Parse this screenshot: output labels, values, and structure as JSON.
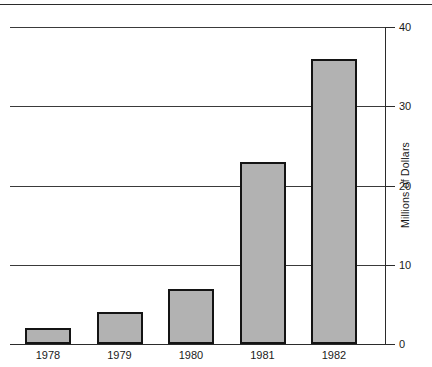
{
  "chart_data": {
    "type": "bar",
    "title": "",
    "subtitle": "",
    "xlabel": "",
    "ylabel": "Millions of Dollars",
    "categories": [
      "1978",
      "1979",
      "1980",
      "1981",
      "1982"
    ],
    "values": [
      2,
      4,
      7,
      23,
      36
    ],
    "series": [
      {
        "name": "Millions of Dollars",
        "values": [
          2,
          4,
          7,
          23,
          36
        ]
      }
    ],
    "ylim": [
      0,
      40
    ],
    "ytick_labels": [
      "0",
      "10",
      "20",
      "30",
      "40"
    ],
    "ytick_values": [
      0,
      10,
      20,
      30,
      40
    ],
    "grid": true,
    "grid_axis": "y",
    "legend": false,
    "legend_position": "none",
    "axis_position": "right",
    "bar_fill_color": "#b2b2b2",
    "bar_border_color": "#141414",
    "axis_color": "#2b2b2b",
    "grid_color": "#3a3a3a",
    "background_color": "#ffffff",
    "annotations": []
  },
  "figure": {
    "top_rule": true
  }
}
